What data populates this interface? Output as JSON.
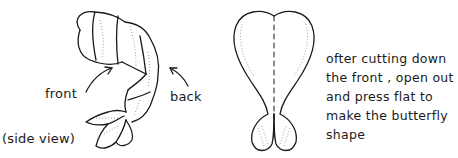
{
  "diagram": {
    "side_view": {
      "labels": {
        "front": "front",
        "back": "back",
        "caption": "(side view)"
      }
    },
    "butterfly_view": {
      "description_lines": [
        "ofter cutting down",
        "the front , open out",
        "and press  flat  to",
        "make  the  butterfly",
        "shape"
      ]
    }
  },
  "colors": {
    "ink": "#1a1a1a",
    "background": "#ffffff"
  }
}
